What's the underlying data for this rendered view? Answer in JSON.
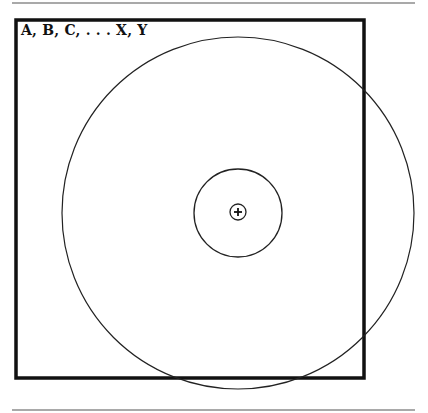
{
  "diagram": {
    "set_label": "A, B, C, . . . X, Y",
    "colors": {
      "stroke": "#111111",
      "rule": "#555555",
      "background": "#ffffff"
    },
    "elements": [
      {
        "type": "rule",
        "position": "top"
      },
      {
        "type": "rectangle",
        "label": "A, B, C, . . . X, Y",
        "role": "universal set"
      },
      {
        "type": "circle",
        "role": "outer circle",
        "extends_beyond_rectangle": true
      },
      {
        "type": "circle",
        "role": "middle circle"
      },
      {
        "type": "circle",
        "role": "inner circle"
      },
      {
        "type": "plus-mark",
        "role": "center point"
      },
      {
        "type": "rule",
        "position": "bottom"
      }
    ]
  }
}
